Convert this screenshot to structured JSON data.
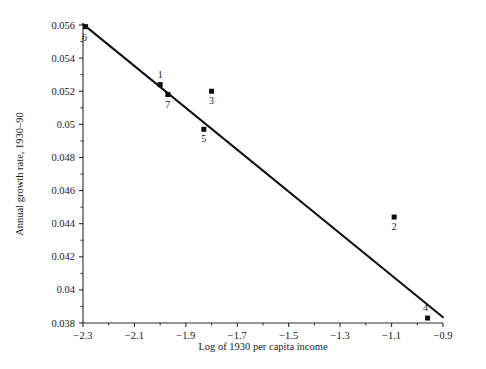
{
  "chart_data": {
    "type": "scatter",
    "title": "",
    "xlabel": "Log of 1930 per capita income",
    "ylabel": "Annual growth rate, 1930–90",
    "xlim": [
      -2.3,
      -0.9
    ],
    "ylim": [
      0.038,
      0.056
    ],
    "grid": false,
    "legend": null,
    "x_ticks": [
      "-2.3",
      "-2.1",
      "-1.9",
      "-1.7",
      "-1.5",
      "-1.3",
      "-1.1",
      "-0.9"
    ],
    "x_tick_values": [
      -2.3,
      -2.1,
      -1.9,
      -1.7,
      -1.5,
      -1.3,
      -1.1,
      -0.9
    ],
    "x_minor_step": 0.1,
    "y_ticks": [
      "0.038",
      "0.04",
      "0.042",
      "0.044",
      "0.046",
      "0.048",
      "0.05",
      "0.052",
      "0.054",
      "0.056"
    ],
    "y_tick_values": [
      0.038,
      0.04,
      0.042,
      0.044,
      0.046,
      0.048,
      0.05,
      0.052,
      0.054,
      0.056
    ],
    "y_minor_step": 0.001,
    "points": [
      {
        "label": "6",
        "x": -2.29,
        "y": 0.0559,
        "label_pos": "below-left"
      },
      {
        "label": "1",
        "x": -2.0,
        "y": 0.0524,
        "label_pos": "above"
      },
      {
        "label": "7",
        "x": -1.97,
        "y": 0.0518,
        "label_pos": "below"
      },
      {
        "label": "3",
        "x": -1.8,
        "y": 0.052,
        "label_pos": "below"
      },
      {
        "label": "5",
        "x": -1.83,
        "y": 0.0497,
        "label_pos": "below"
      },
      {
        "label": "2",
        "x": -1.09,
        "y": 0.0444,
        "label_pos": "below"
      },
      {
        "label": "4",
        "x": -0.96,
        "y": 0.0383,
        "label_pos": "above-left"
      }
    ],
    "fit_line": {
      "type": "linear-regression",
      "x_start": -2.3,
      "y_start": 0.05605,
      "x_end": -0.9,
      "y_end": 0.03835
    },
    "colors": {
      "marker": "#0d0d0d",
      "line": "#111111",
      "axis": "#2a2a2a",
      "background": "#ffffff"
    }
  }
}
